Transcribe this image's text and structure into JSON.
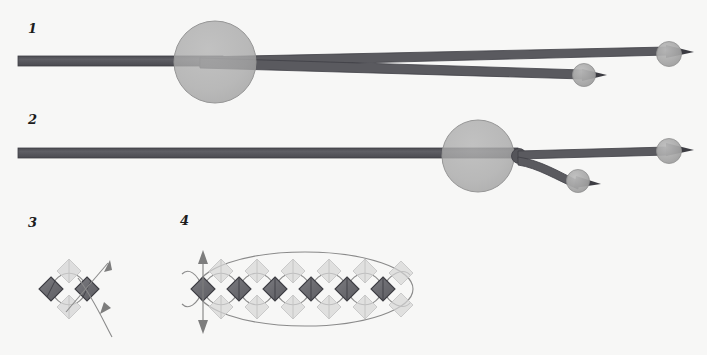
{
  "figure": {
    "background_color": "#f7f7f6",
    "width": 707,
    "height": 355,
    "kind": "scientific-schematic"
  },
  "palette": {
    "beam_dark": "#5a5a5f",
    "beam_dark_edge": "#3f3f45",
    "sphere_gray": "#a8a8a8",
    "sphere_gray_edge": "#8f8f8f",
    "big_circle_fill": "#a9a9a9",
    "big_circle_edge": "#9a9a9a",
    "knot_dark": "#55555a",
    "diamond_dark_fill": "#6e6e73",
    "diamond_dark_edge": "#3c3c42",
    "diamond_light_fill": "#d2d2d2",
    "diamond_light_edge": "#c2c2c2",
    "curve_stroke": "#8a8a8a",
    "arrow_stroke": "#8a8a8a",
    "label_color": "#1c1c1c"
  },
  "panels": [
    {
      "id": "panel-1",
      "label": "1",
      "label_x": 28,
      "label_y": 22,
      "description": "single horizontal beam entering a large translucent sphere and splitting into two diverging beams each terminating in a small sphere with arrow tip"
    },
    {
      "id": "panel-2",
      "label": "2",
      "label_x": 28,
      "label_y": 113,
      "description": "single horizontal beam passing a large translucent sphere, splitting at a dark knot into a straight beam and a downward-curving beam, each ending in a small sphere with arrow tip"
    },
    {
      "id": "panel-3",
      "label": "3",
      "label_x": 28,
      "label_y": 216,
      "description": "two diamond nodes joined by lens-shaped loops with a diagonal double arrow crossing through"
    },
    {
      "id": "panel-4",
      "label": "4",
      "label_x": 180,
      "label_y": 214,
      "description": "chain of six diamond nodes linked by lens-shaped loops, enclosed by a large ellipse, with a vertical double-headed arrow at the left end"
    }
  ],
  "panel1": {
    "main_beam": {
      "x1": 18,
      "y1": 56,
      "x2": 230,
      "y2": 56,
      "thickness": 10
    },
    "big_sphere": {
      "cx": 215,
      "cy": 62,
      "r": 41
    },
    "upper_output": {
      "x1": 215,
      "y1": 62,
      "x2": 663,
      "y2": 55,
      "thickness": 8
    },
    "lower_output": {
      "x1": 215,
      "y1": 62,
      "x2": 578,
      "y2": 75,
      "thickness": 8
    },
    "end_spheres": [
      {
        "cx": 669,
        "cy": 54,
        "r": 12,
        "arrow_tip_x": 691
      },
      {
        "cx": 584,
        "cy": 75,
        "r": 11,
        "arrow_tip_x": 604
      }
    ]
  },
  "panel2": {
    "main_beam": {
      "x1": 18,
      "y1": 148,
      "x2": 470,
      "y2": 148,
      "thickness": 10
    },
    "big_sphere": {
      "cx": 478,
      "cy": 156,
      "r": 36
    },
    "knot": {
      "cx": 519,
      "cy": 156,
      "r": 7
    },
    "straight_output": {
      "x1": 519,
      "y1": 153,
      "x2": 660,
      "y2": 151,
      "thickness": 7
    },
    "curved_output": {
      "x1": 519,
      "y1": 158,
      "x2": 570,
      "y2": 178,
      "thickness": 7
    },
    "end_spheres": [
      {
        "cx": 669,
        "cy": 151,
        "r": 12,
        "arrow_tip_x": 691
      },
      {
        "cx": 578,
        "cy": 180,
        "r": 11,
        "arrow_tip_x": 598
      }
    ]
  },
  "panel3": {
    "node_spacing": 36,
    "nodes": [
      {
        "cx": 51,
        "cy": 289
      },
      {
        "cx": 87,
        "cy": 289
      }
    ],
    "diamond_radius": 12,
    "ghost_nodes": [
      {
        "cx": 69,
        "cy": 271
      },
      {
        "cx": 69,
        "cy": 307
      }
    ],
    "arrow": {
      "from_x": 68,
      "from_y": 310,
      "to_x": 110,
      "to_y": 262,
      "tail_x": 113,
      "tail_y": 336,
      "double_headed": true
    }
  },
  "panel4": {
    "node_count": 6,
    "node_start_x": 203,
    "node_spacing": 36,
    "node_cy": 289,
    "diamond_radius": 12,
    "enclosing_ellipse": {
      "cx": 305,
      "cy": 289,
      "rx": 108,
      "ry": 37
    },
    "vertical_arrow": {
      "x": 203,
      "y_top": 253,
      "y_bottom": 330,
      "double_headed": true
    }
  }
}
